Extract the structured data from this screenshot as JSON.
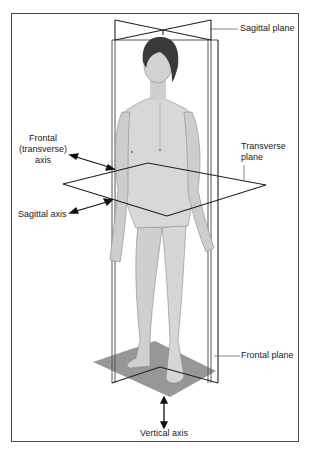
{
  "figure": {
    "labels": {
      "sagittal_plane": "Sagittal plane",
      "frontal_axis_line1": "Frontal",
      "frontal_axis_line2": "(transverse)",
      "frontal_axis_line3": "axis",
      "transverse_plane_line1": "Transverse",
      "transverse_plane_line2": "plane",
      "sagittal_axis": "Sagittal axis",
      "frontal_plane": "Frontal plane",
      "vertical_axis": "Vertical axis"
    },
    "colors": {
      "plane_lines": "#222222",
      "frontal_plane_edge": "#555555",
      "floor_plane": "#8c8c8c",
      "skin": "#d4d4d4",
      "skin_shadow": "#a8a8a8",
      "hair": "#3a3a3a",
      "frame": "#4a4a4a"
    }
  }
}
